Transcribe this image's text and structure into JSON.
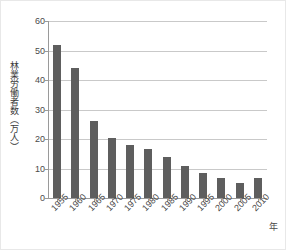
{
  "chart_data": {
    "type": "bar",
    "title": "",
    "subtitle": "",
    "xlabel": "年",
    "ylabel": "林業労働者数（万人）",
    "categories": [
      "1955",
      "1960",
      "1965",
      "1970",
      "1975",
      "1980",
      "1985",
      "1990",
      "1995",
      "2000",
      "2005",
      "2010"
    ],
    "values": [
      52,
      44,
      26,
      20.5,
      18,
      16.5,
      14,
      11,
      8.5,
      6.7,
      5,
      6.9
    ],
    "series": [
      {
        "name": "林業労働者数",
        "values": [
          52,
          44,
          26,
          20.5,
          18,
          16.5,
          14,
          11,
          8.5,
          6.7,
          5,
          6.9
        ]
      }
    ],
    "ylim": [
      0,
      60
    ],
    "ytick_values": [
      0,
      10,
      20,
      30,
      40,
      50,
      60
    ],
    "ytick_labels": [
      "0",
      "10",
      "20",
      "30",
      "40",
      "50",
      "60"
    ],
    "grid": true,
    "grid_axis": "y",
    "legend": false,
    "legend_position": "none",
    "bar_color": "#5e5e5e",
    "gridline_color": "#c9c9c9",
    "axis_color": "#9a9a9a",
    "background_color": "#ffffff",
    "text_color": "#4a4a4a",
    "xtick_label_rotation": -45
  },
  "axes": {
    "y_title": "林業労働者数（万人）",
    "x_unit": "年"
  }
}
